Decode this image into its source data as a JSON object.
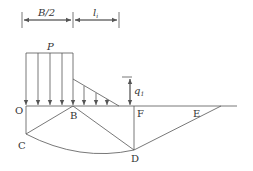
{
  "diagram": {
    "dimensions": {
      "half_width": "B/2",
      "length": "l",
      "length_sub": "i",
      "surcharge": "q",
      "surcharge_sub": "1"
    },
    "load": {
      "label": "P"
    },
    "points": {
      "O": "O",
      "B": "B",
      "C": "C",
      "D": "D",
      "E": "E",
      "F": "F"
    },
    "colors": {
      "line": "#555555",
      "text": "#333333",
      "background": "#ffffff"
    }
  }
}
